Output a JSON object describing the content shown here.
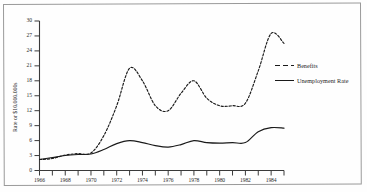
{
  "chart_data": {
    "type": "line",
    "title": "",
    "xlabel": "",
    "ylabel": "Rate or $10,000,000s",
    "xlim": [
      1966,
      1985
    ],
    "ylim": [
      0,
      30
    ],
    "ytick_values": [
      0,
      3,
      6,
      9,
      12,
      15,
      18,
      21,
      24,
      27,
      30
    ],
    "ytick_labels": [
      "0",
      "3",
      "6",
      "9",
      "12",
      "15",
      "18",
      "21",
      "24",
      "27",
      "30"
    ],
    "xtick_values": [
      1966,
      1967,
      1968,
      1969,
      1970,
      1971,
      1972,
      1973,
      1974,
      1975,
      1976,
      1977,
      1978,
      1979,
      1980,
      1981,
      1982,
      1983,
      1984,
      1985
    ],
    "xtick_labels_shown": [
      "1966",
      "1968",
      "1970",
      "1972",
      "1974",
      "1976",
      "1978",
      "1980",
      "1982",
      "1984"
    ],
    "grid": false,
    "legend_position": "right-upper",
    "x": [
      1966,
      1967,
      1968,
      1969,
      1970,
      1971,
      1972,
      1973,
      1974,
      1975,
      1976,
      1977,
      1978,
      1979,
      1980,
      1981,
      1982,
      1983,
      1984,
      1985
    ],
    "series": [
      {
        "name": "Benefits",
        "style": "dashed",
        "color": "#1a1a1a",
        "values": [
          2.2,
          2.4,
          3.1,
          3.4,
          3.5,
          7.0,
          13.0,
          20.5,
          18.0,
          13.0,
          12.0,
          15.5,
          18.0,
          14.5,
          13.0,
          13.0,
          13.5,
          20.0,
          27.5,
          25.5
        ]
      },
      {
        "name": "Unemployment Rate",
        "style": "solid",
        "color": "#1a1a1a",
        "values": [
          2.2,
          2.6,
          3.0,
          3.2,
          3.3,
          4.2,
          5.4,
          6.0,
          5.6,
          5.0,
          4.7,
          5.2,
          6.0,
          5.6,
          5.5,
          5.6,
          5.6,
          7.8,
          8.6,
          8.5
        ]
      }
    ]
  },
  "legend": {
    "items": [
      {
        "label": "Benefits",
        "style": "dashed"
      },
      {
        "label": "Unemployment Rate",
        "style": "solid"
      }
    ]
  }
}
